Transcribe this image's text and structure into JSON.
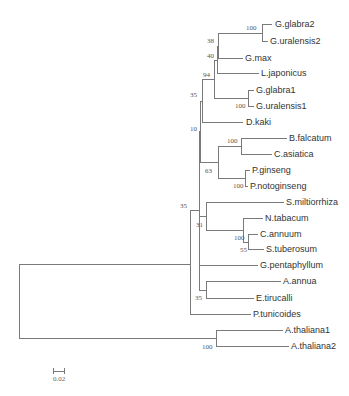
{
  "leaves": [
    "G.glabra2",
    "G.uralensis2",
    "G.max",
    "L.japonicus",
    "G.glabra1",
    "G.uralensis1",
    "D.kaki",
    "B.falcatum",
    "C.asiatica",
    "P.ginseng",
    "P.notoginseng",
    "S.miltiorrhiza",
    "N.tabacum",
    "C.annuum",
    "S.tuberosum",
    "G.pentaphyllum",
    "A.annua",
    "E.tirucalli",
    "P.tunicoides",
    "A.thaliana1",
    "A.thaliana2"
  ],
  "bootstrap": {
    "glabra2_uralensis2": "100",
    "n38": "38",
    "n40": "40",
    "n94": "94",
    "glabra1_uralensis1": "100",
    "n35a": "35",
    "n10": "10",
    "falcatum_asiatica": "100",
    "n63": "63",
    "ginseng_notoginseng": "100",
    "n35b": "35",
    "n31": "31",
    "annuum_tuberosum_100": "100",
    "annuum_tuberosum_55": "55",
    "annua_tirucalli": "35",
    "thaliana": "100"
  },
  "scale_bar": {
    "label": "0.02"
  }
}
